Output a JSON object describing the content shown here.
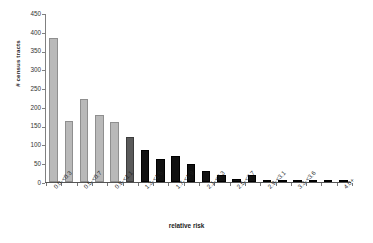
{
  "chart_data": {
    "type": "bar",
    "title": "",
    "xlabel": "relative risk",
    "ylabel": "# census tracts",
    "ylim": [
      0,
      450
    ],
    "yticks": [
      0,
      50,
      100,
      150,
      200,
      250,
      300,
      350,
      400,
      450
    ],
    "grid": false,
    "legend": "none",
    "categories": [
      "0.0-<0.3",
      "0.3-<0.5",
      "0.5-<0.7",
      "0.7-<0.9",
      "0.9-<1.1",
      "1.1-<1.3",
      "1.3-<1.5",
      "1.5-<1.7",
      "1.7-<1.9",
      "1.9-<2.1",
      "2.1-<2.3",
      "2.3-<2.5",
      "2.5-<2.7",
      "2.7-<2.9",
      "2.9-<3.1",
      "3.1-<3.3",
      "3.3-<3.6",
      "3.6-<3.9",
      "3.9-<4.0",
      "4.0+"
    ],
    "tick_labels_shown": [
      "0.0-<0.3",
      "0.5-<0.7",
      "0.9-<1.1",
      "1.3-<1.5",
      "1.7-<1.9",
      "2.1-<2.3",
      "2.5-<2.7",
      "2.9-<3.1",
      "3.3-<3.6",
      "3.6-<3.9",
      "4.0+"
    ],
    "values": [
      387,
      163,
      222,
      180,
      161,
      120,
      86,
      61,
      71,
      47,
      29,
      20,
      7,
      18,
      4,
      3,
      1,
      1,
      0,
      6
    ],
    "bar_colors": [
      "light",
      "light",
      "light",
      "light",
      "light",
      "mid",
      "dark",
      "dark",
      "dark",
      "dark",
      "dark",
      "dark",
      "dark",
      "dark",
      "dark",
      "dark",
      "dark",
      "dark",
      "dark",
      "dark"
    ],
    "colors": {
      "light": "#b9b9b9",
      "mid": "#5a5a5a",
      "dark": "#111111",
      "axis": "#808080",
      "text": "#1f1f1f",
      "background": "#ffffff"
    }
  }
}
